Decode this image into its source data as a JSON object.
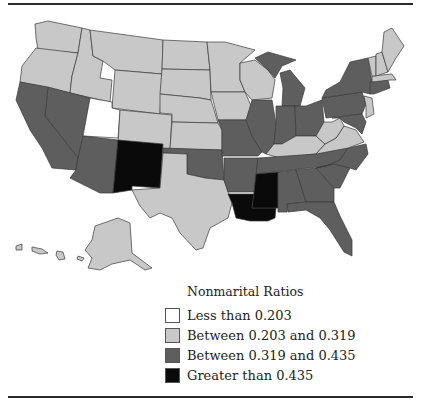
{
  "legend": {
    "title": "Nonmarital Ratios",
    "items": [
      {
        "label": "Less than 0.203",
        "color": "#ffffff"
      },
      {
        "label": "Between 0.203 and 0.319",
        "color": "#c8c8c8"
      },
      {
        "label": "Between 0.319 and 0.435",
        "color": "#5e5e5e"
      },
      {
        "label": "Greater than 0.435",
        "color": "#0a0a0a"
      }
    ]
  },
  "map": {
    "categories": {
      "lowest": [
        "Utah"
      ],
      "low": [
        "Washington",
        "Oregon",
        "Idaho",
        "Montana",
        "Wyoming",
        "Colorado",
        "North Dakota",
        "South Dakota",
        "Nebraska",
        "Kansas",
        "Minnesota",
        "Iowa",
        "Wisconsin",
        "Texas",
        "Kentucky",
        "West Virginia",
        "Virginia",
        "New Jersey",
        "Vermont",
        "New Hampshire",
        "Maine",
        "Massachusetts",
        "Alaska",
        "Hawaii"
      ],
      "high": [
        "California",
        "Nevada",
        "Arizona",
        "Oklahoma",
        "Missouri",
        "Arkansas",
        "Illinois",
        "Indiana",
        "Michigan",
        "Ohio",
        "Pennsylvania",
        "New York",
        "Tennessee",
        "Alabama",
        "Georgia",
        "South Carolina",
        "North Carolina",
        "Florida",
        "Maryland",
        "Delaware",
        "Connecticut",
        "Rhode Island"
      ],
      "highest": [
        "New Mexico",
        "Louisiana",
        "Mississippi"
      ]
    }
  }
}
